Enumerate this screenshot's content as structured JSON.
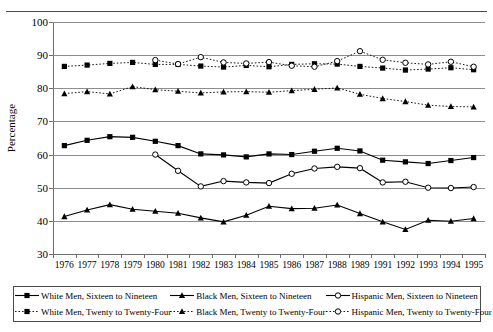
{
  "figure": {
    "top_rule": true,
    "ghost_caption": ""
  },
  "axes": {
    "ylabel": "Percentage",
    "yticks": [
      30,
      40,
      50,
      60,
      70,
      80,
      90,
      100
    ],
    "ylim": [
      30,
      100
    ],
    "xlabels": [
      "1976",
      "1977",
      "1978",
      "1979",
      "1980",
      "1981",
      "1982",
      "1983",
      "1984",
      "1985",
      "1986",
      "1987",
      "1988",
      "1989",
      "1991",
      "1992",
      "1993",
      "1994",
      "1995"
    ]
  },
  "legend": {
    "items": [
      {
        "label": "White Men, Sixteen to Nineteen",
        "marker": "filled-square",
        "line": "solid",
        "name": "legend-white-16-19"
      },
      {
        "label": "Black Men, Sixteen to Nineteen",
        "marker": "filled-triangle",
        "line": "solid",
        "name": "legend-black-16-19"
      },
      {
        "label": "Hispanic Men, Sixteen to Nineteen",
        "marker": "open-circle",
        "line": "solid",
        "name": "legend-hispanic-16-19"
      },
      {
        "label": "White Men, Twenty to Twenty-Four",
        "marker": "filled-square",
        "line": "dotted",
        "name": "legend-white-20-24"
      },
      {
        "label": "Black Men, Twenty to Twenty-Four",
        "marker": "filled-triangle",
        "line": "dotted",
        "name": "legend-black-20-24"
      },
      {
        "label": "Hispanic Men, Twenty to Twenty-Four",
        "marker": "open-circle",
        "line": "dotted",
        "name": "legend-hispanic-20-24"
      }
    ]
  },
  "chart_data": {
    "type": "line",
    "title": "",
    "xlabel": "",
    "ylabel": "Percentage",
    "ylim": [
      30,
      100
    ],
    "yticks": [
      30,
      40,
      50,
      60,
      70,
      80,
      90,
      100
    ],
    "grid": "horizontal",
    "legend_position": "bottom",
    "categories": [
      "1976",
      "1977",
      "1978",
      "1979",
      "1980",
      "1981",
      "1982",
      "1983",
      "1984",
      "1985",
      "1986",
      "1987",
      "1988",
      "1989",
      "1991",
      "1992",
      "1993",
      "1994",
      "1995"
    ],
    "series": [
      {
        "name": "White Men, Sixteen to Nineteen",
        "marker": "filled-square",
        "line": "solid",
        "color": "#000000",
        "values": [
          62.7,
          64.3,
          65.4,
          65.2,
          64.0,
          62.7,
          60.2,
          59.9,
          59.3,
          60.2,
          60.0,
          61.0,
          61.9,
          61.1,
          58.3,
          57.8,
          57.3,
          58.2,
          59.1
        ]
      },
      {
        "name": "White Men, Twenty to Twenty-Four",
        "marker": "filled-square",
        "line": "dotted",
        "color": "#000000",
        "values": [
          86.6,
          87.0,
          87.5,
          87.8,
          87.2,
          87.2,
          86.7,
          86.4,
          86.9,
          86.5,
          87.2,
          87.4,
          87.3,
          86.6,
          86.1,
          85.5,
          85.8,
          86.2,
          85.6
        ]
      },
      {
        "name": "Black Men, Sixteen to Nineteen",
        "marker": "filled-triangle",
        "line": "solid",
        "color": "#000000",
        "values": [
          41.3,
          43.3,
          44.9,
          43.5,
          42.9,
          42.3,
          40.9,
          39.7,
          41.7,
          44.4,
          43.7,
          43.8,
          44.8,
          42.2,
          39.7,
          37.4,
          40.2,
          39.9,
          40.7
        ]
      },
      {
        "name": "Black Men, Twenty to Twenty-Four",
        "marker": "filled-triangle",
        "line": "dotted",
        "color": "#000000",
        "values": [
          78.4,
          79.0,
          78.3,
          80.5,
          79.6,
          79.1,
          78.6,
          78.9,
          79.0,
          78.8,
          79.3,
          79.7,
          80.1,
          78.2,
          76.9,
          76.0,
          74.9,
          74.5,
          74.4
        ]
      },
      {
        "name": "Hispanic Men, Sixteen to Nineteen",
        "marker": "open-circle",
        "line": "solid",
        "color": "#000000",
        "values": [
          null,
          null,
          null,
          null,
          60.0,
          55.1,
          50.4,
          52.0,
          51.6,
          51.4,
          54.2,
          55.8,
          56.3,
          55.9,
          51.6,
          51.8,
          50.0,
          49.9,
          50.2
        ]
      },
      {
        "name": "Hispanic Men, Twenty to Twenty-Four",
        "marker": "open-circle",
        "line": "dotted",
        "color": "#000000",
        "values": [
          null,
          null,
          null,
          null,
          88.5,
          87.3,
          89.4,
          87.8,
          87.5,
          87.9,
          86.8,
          86.5,
          88.2,
          91.2,
          88.6,
          87.7,
          87.2,
          88.0,
          86.5
        ]
      }
    ]
  }
}
